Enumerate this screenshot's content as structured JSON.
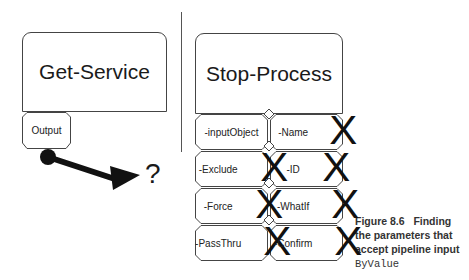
{
  "left_command": {
    "name": "Get-Service",
    "output_label": "Output"
  },
  "pipeline_target": "?",
  "right_command": {
    "name": "Stop-Process",
    "parameters": [
      {
        "label": "-inputObject",
        "crossed": false
      },
      {
        "label": "-Name",
        "crossed": true
      },
      {
        "label": "-Exclude",
        "crossed": true
      },
      {
        "label": "-ID",
        "crossed": true
      },
      {
        "label": "-Force",
        "crossed": true
      },
      {
        "label": "-WhatIf",
        "crossed": true
      },
      {
        "label": "-PassThru",
        "crossed": true
      },
      {
        "label": "-Confirm",
        "crossed": true
      }
    ],
    "cross_glyph": "X"
  },
  "caption": {
    "number": "Figure 8.6",
    "text": "Finding the parameters that accept pipeline input",
    "code": "ByValue"
  },
  "colors": {
    "stroke": "#444444",
    "arrow": "#111111",
    "caption": "#333333"
  }
}
